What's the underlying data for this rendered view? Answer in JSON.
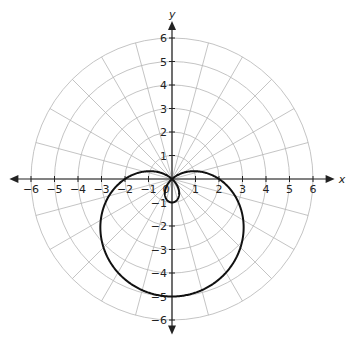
{
  "chart_data": {
    "type": "line",
    "subtype": "polar",
    "title": "",
    "equation": "r = 2 - 3 sin(theta)",
    "curve_name": "limacon with inner loop",
    "xlabel": "x",
    "ylabel": "y",
    "xlim": [
      -6,
      6
    ],
    "ylim": [
      -6,
      6
    ],
    "x_ticks": [
      -6,
      -5,
      -4,
      -3,
      -2,
      -1,
      0,
      1,
      2,
      3,
      4,
      5,
      6
    ],
    "y_ticks": [
      -6,
      -5,
      -4,
      -3,
      -2,
      -1,
      1,
      2,
      3,
      4,
      5,
      6
    ],
    "x_tick_labels": [
      "−6",
      "−5",
      "−4",
      "−3",
      "−2",
      "−1",
      "0",
      "1",
      "2",
      "3",
      "4",
      "5",
      "6"
    ],
    "y_tick_labels": [
      "−6",
      "−5",
      "−4",
      "−3",
      "−2",
      "−1",
      "1",
      "2",
      "3",
      "4",
      "5",
      "6"
    ],
    "grid": {
      "type": "polar",
      "circle_radii": [
        1,
        2,
        3,
        4,
        5,
        6
      ],
      "radial_line_step_deg": 15
    },
    "key_points": [
      {
        "theta_deg": 0,
        "r": 2,
        "x": 2,
        "y": 0
      },
      {
        "theta_deg": 180,
        "r": 2,
        "x": -2,
        "y": 0
      },
      {
        "theta_deg": 270,
        "r": 5,
        "x": 0,
        "y": -5
      },
      {
        "theta_deg": 90,
        "r": -1,
        "x": 0,
        "y": -1
      },
      {
        "theta_deg": 41.8,
        "r": 0,
        "x": 0,
        "y": 0
      },
      {
        "theta_deg": 138.2,
        "r": 0,
        "x": 0,
        "y": 0
      }
    ],
    "legend": null
  },
  "colors": {
    "grid": "#b5b5b5",
    "axis": "#222222",
    "curve": "#111111",
    "background": "#ffffff"
  }
}
